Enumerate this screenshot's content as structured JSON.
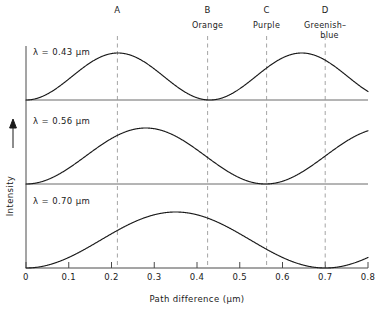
{
  "chart_data": {
    "type": "line",
    "title": "",
    "xlabel": "Path difference (μm)",
    "ylabel": "Intensity",
    "xlim": [
      0,
      0.8
    ],
    "ylim": [
      0,
      1
    ],
    "grid": false,
    "legend_position": "inline-panel-labels",
    "x_ticks": [
      "0",
      "0.1",
      "0.2",
      "0.3",
      "0.4",
      "0.5",
      "0.6",
      "0.7",
      "0.8"
    ],
    "x_tick_values": [
      0,
      0.1,
      0.2,
      0.3,
      0.4,
      0.5,
      0.6,
      0.7,
      0.8
    ],
    "panels": [
      {
        "label": "λ = 0.43 μm",
        "wavelength": 0.43,
        "zeros": [
          0,
          0.43,
          0.86
        ],
        "peaks": [
          0.215,
          0.645
        ],
        "value_at_0_8": 0.56
      },
      {
        "label": "λ = 0.56 μm",
        "wavelength": 0.56,
        "zeros": [
          0,
          0.56
        ],
        "peaks": [
          0.28,
          0.84
        ],
        "value_at_0_8": 0.78
      },
      {
        "label": "λ = 0.70 μm",
        "wavelength": 0.7,
        "zeros": [
          0,
          0.7
        ],
        "peaks": [
          0.35
        ],
        "value_at_0_8": 0.43
      }
    ],
    "markers": [
      {
        "letter": "A",
        "color_name": "",
        "color_name_line2": "",
        "x": 0.214
      },
      {
        "letter": "B",
        "color_name": "Orange",
        "color_name_line2": "",
        "x": 0.425
      },
      {
        "letter": "C",
        "color_name": "Purple",
        "color_name_line2": "",
        "x": 0.563
      },
      {
        "letter": "D",
        "color_name": "Greenish–",
        "color_name_line2": "blue",
        "x": 0.7
      }
    ],
    "series": [
      {
        "name": "λ = 0.43 μm",
        "formula": "sin^2(pi*x/0.43)",
        "x": [
          0,
          0.05,
          0.1,
          0.15,
          0.215,
          0.25,
          0.3,
          0.35,
          0.4,
          0.43,
          0.5,
          0.55,
          0.6,
          0.645,
          0.7,
          0.75,
          0.8
        ],
        "y": [
          0,
          0.13,
          0.47,
          0.8,
          1.0,
          0.96,
          0.75,
          0.44,
          0.1,
          0,
          0.23,
          0.6,
          0.9,
          1.0,
          0.92,
          0.73,
          0.56
        ]
      },
      {
        "name": "λ = 0.56 μm",
        "formula": "sin^2(pi*x/0.56)",
        "x": [
          0,
          0.05,
          0.1,
          0.15,
          0.2,
          0.28,
          0.35,
          0.4,
          0.45,
          0.5,
          0.56,
          0.62,
          0.68,
          0.74,
          0.8
        ],
        "y": [
          0,
          0.08,
          0.3,
          0.56,
          0.79,
          1.0,
          0.87,
          0.7,
          0.48,
          0.26,
          0,
          0.1,
          0.36,
          0.6,
          0.78
        ]
      },
      {
        "name": "λ = 0.70 μm",
        "formula": "sin^2(pi*x/0.70)",
        "x": [
          0,
          0.05,
          0.1,
          0.15,
          0.2,
          0.25,
          0.3,
          0.35,
          0.4,
          0.45,
          0.5,
          0.55,
          0.6,
          0.65,
          0.7,
          0.75,
          0.8
        ],
        "y": [
          0,
          0.05,
          0.19,
          0.4,
          0.62,
          0.83,
          0.97,
          1.0,
          0.95,
          0.8,
          0.58,
          0.34,
          0.15,
          0.03,
          0,
          0.06,
          0.22
        ]
      }
    ]
  },
  "axes": {
    "x_axis_title": "Path difference (μm)",
    "y_axis_title": "Intensity",
    "y_arrow": "up-arrow"
  }
}
